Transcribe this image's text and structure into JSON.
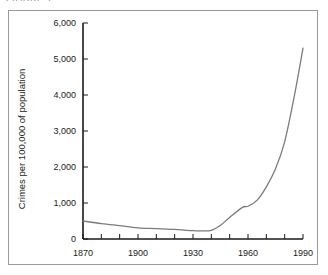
{
  "figure": {
    "caption_clipped": "FIGURE 1",
    "border_color": "#9a9a9a",
    "background_color": "#ffffff"
  },
  "chart_data": {
    "type": "line",
    "title": "",
    "xlabel": "",
    "ylabel": "Crimes per 100,000 of population",
    "xlim": [
      1870,
      1990
    ],
    "ylim": [
      0,
      6000
    ],
    "grid": false,
    "legend": null,
    "line_color": "#7b7b7b",
    "axis_color": "#1a1a1a",
    "y_ticks": [
      0,
      1000,
      2000,
      3000,
      4000,
      5000,
      6000
    ],
    "y_tick_labels": [
      "0",
      "1,000",
      "2,000",
      "3,000",
      "4,000",
      "5,000",
      "6,000"
    ],
    "x_ticks": [
      1870,
      1880,
      1890,
      1900,
      1910,
      1920,
      1930,
      1940,
      1950,
      1960,
      1970,
      1980,
      1990
    ],
    "x_tick_labels_major": [
      "1870",
      "1900",
      "1930",
      "1960",
      "1990"
    ],
    "x_major_ticks": [
      1870,
      1900,
      1930,
      1960,
      1990
    ],
    "x": [
      1870,
      1880,
      1890,
      1900,
      1910,
      1920,
      1930,
      1935,
      1940,
      1945,
      1950,
      1957,
      1960,
      1965,
      1970,
      1975,
      1980,
      1985,
      1990
    ],
    "values": [
      500,
      430,
      370,
      310,
      290,
      265,
      230,
      225,
      240,
      380,
      600,
      880,
      910,
      1080,
      1450,
      1950,
      2700,
      3900,
      5300
    ],
    "series": [
      {
        "name": "Crimes per 100,000 of population",
        "values": [
          500,
          430,
          370,
          310,
          290,
          265,
          230,
          225,
          240,
          380,
          600,
          880,
          910,
          1080,
          1450,
          1950,
          2700,
          3900,
          5300
        ]
      }
    ]
  }
}
